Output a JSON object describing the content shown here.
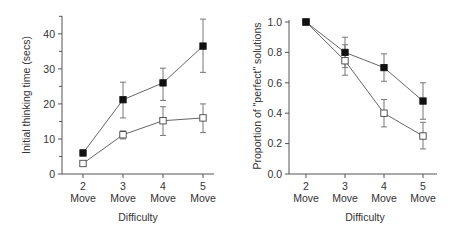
{
  "chart_data": [
    {
      "type": "line",
      "title": "",
      "xlabel": "Difficulty",
      "ylabel": "Initial thinking time (secs)",
      "categories": [
        "2 Move",
        "3 Move",
        "4 Move",
        "5 Move"
      ],
      "category_numbers": [
        "2",
        "3",
        "4",
        "5"
      ],
      "category_suffix": "Move",
      "ylim": [
        0,
        45
      ],
      "yticks": [
        0,
        10,
        20,
        30,
        40
      ],
      "yticks_minor": [
        5,
        15,
        25,
        35,
        45
      ],
      "grid": false,
      "legend": null,
      "series": [
        {
          "name": "filled squares",
          "marker": "filled-square",
          "values": [
            6,
            21.2,
            26,
            36.5
          ],
          "error_low": [
            5.2,
            16,
            21,
            29
          ],
          "error_high": [
            6.8,
            26.2,
            30.2,
            44.2
          ]
        },
        {
          "name": "open squares",
          "marker": "open-square",
          "values": [
            3,
            11.2,
            15.2,
            16
          ],
          "error_low": [
            3,
            10,
            11,
            11.8
          ],
          "error_high": [
            3,
            12.3,
            19.2,
            20
          ]
        }
      ]
    },
    {
      "type": "line",
      "title": "",
      "xlabel": "Difficulty",
      "ylabel": "Proportion of \"perfect\" solutions",
      "categories": [
        "2 Move",
        "3 Move",
        "4 Move",
        "5 Move"
      ],
      "category_numbers": [
        "2",
        "3",
        "4",
        "5"
      ],
      "category_suffix": "Move",
      "ylim": [
        0,
        1.0
      ],
      "yticks": [
        0.0,
        0.2,
        0.4,
        0.6,
        0.8,
        1.0
      ],
      "ytick_labels": [
        "0.0",
        "0.2",
        "0.4",
        "0.6",
        "0.8",
        "1.0"
      ],
      "grid": false,
      "legend": null,
      "series": [
        {
          "name": "filled squares",
          "marker": "filled-square",
          "values": [
            1.0,
            0.8,
            0.7,
            0.48
          ],
          "error_low": [
            1.0,
            0.7,
            0.61,
            0.36
          ],
          "error_high": [
            1.0,
            0.9,
            0.79,
            0.6
          ]
        },
        {
          "name": "open squares",
          "marker": "open-square",
          "values": [
            1.0,
            0.745,
            0.4,
            0.25
          ],
          "error_low": [
            1.0,
            0.65,
            0.31,
            0.165
          ],
          "error_high": [
            1.0,
            0.85,
            0.49,
            0.34
          ]
        }
      ]
    }
  ],
  "left": {
    "ylabel": "Initial thinking time (secs)",
    "xlabel": "Difficulty",
    "yticks": [
      "0",
      "10",
      "20",
      "30",
      "40"
    ],
    "xticks": [
      {
        "num": "2",
        "word": "Move"
      },
      {
        "num": "3",
        "word": "Move"
      },
      {
        "num": "4",
        "word": "Move"
      },
      {
        "num": "5",
        "word": "Move"
      }
    ]
  },
  "right": {
    "ylabel": "Proportion of \"perfect\" solutions",
    "xlabel": "Difficulty",
    "yticks": [
      "0.0",
      "0.2",
      "0.4",
      "0.6",
      "0.8",
      "1.0"
    ],
    "xticks": [
      {
        "num": "2",
        "word": "Move"
      },
      {
        "num": "3",
        "word": "Move"
      },
      {
        "num": "4",
        "word": "Move"
      },
      {
        "num": "5",
        "word": "Move"
      }
    ]
  }
}
